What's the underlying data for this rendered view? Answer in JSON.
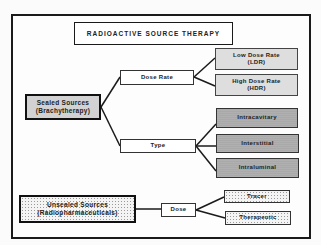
{
  "title": "RADIOACTIVE SOURCE THERAPY",
  "colors": {
    "frame": "#1a1a1a",
    "low_high_dose_fill": "#dedede",
    "type_fill": "#a9a9a9",
    "sealed_fill": "#d2d2d2",
    "dotted_fill": "#f4f4f4"
  },
  "nodes": {
    "sealed": "Sealed Sources\n(Brachytherapy)",
    "unsealed": "Unsealed Sources\n(Radiopharmaceuticals)",
    "dose_rate": "Dose Rate",
    "type": "Type",
    "dose": "Dose",
    "ldr": "Low Dose Rate\n(LDR)",
    "hdr": "High Dose Rate\n(HDR)",
    "intracavitary": "Intracavitary",
    "interstitial": "Interstitial",
    "intraluminal": "Intraluminal",
    "tracer": "Tracer",
    "therapeutic": "Therapeutic"
  },
  "edges": [
    [
      "sealed",
      "dose_rate"
    ],
    [
      "sealed",
      "type"
    ],
    [
      "dose_rate",
      "ldr"
    ],
    [
      "dose_rate",
      "hdr"
    ],
    [
      "type",
      "intracavitary"
    ],
    [
      "type",
      "interstitial"
    ],
    [
      "type",
      "intraluminal"
    ],
    [
      "unsealed",
      "dose"
    ],
    [
      "dose",
      "tracer"
    ],
    [
      "dose",
      "therapeutic"
    ]
  ]
}
